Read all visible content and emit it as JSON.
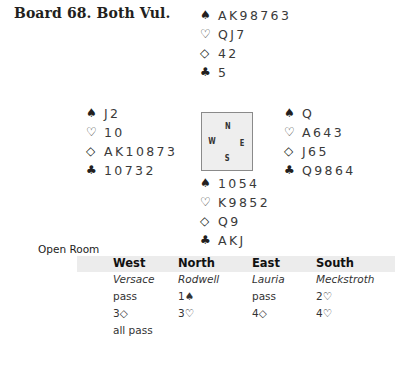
{
  "title": "Board 68.  Both Vul.",
  "suit_icons": {
    "spade": "♠",
    "heart": "♡",
    "diamond": "◇",
    "club": "♣"
  },
  "hands": {
    "north": {
      "spades": "AK98763",
      "hearts": "QJ7",
      "diamonds": "42",
      "clubs": "5"
    },
    "west": {
      "spades": "J2",
      "hearts": "10",
      "diamonds": "AK10873",
      "clubs": "10732"
    },
    "east": {
      "spades": "Q",
      "hearts": "A643",
      "diamonds": "J65",
      "clubs": "Q9864"
    },
    "south": {
      "spades": "1054",
      "hearts": "K9852",
      "diamonds": "Q9",
      "clubs": "AKJ"
    }
  },
  "compass": {
    "n": "N",
    "w": "W",
    "e": "E",
    "s": "S"
  },
  "room_label": "Open Room",
  "auction": {
    "headers": [
      "West",
      "North",
      "East",
      "South"
    ],
    "players": [
      "Versace",
      "Rodwell",
      "Lauria",
      "Meckstroth"
    ],
    "rounds": [
      [
        "pass",
        "1♠",
        "pass",
        "2♡"
      ],
      [
        "3◇",
        "3♡",
        "4◇",
        "4♡"
      ],
      [
        "all pass",
        "",
        "",
        ""
      ]
    ]
  }
}
